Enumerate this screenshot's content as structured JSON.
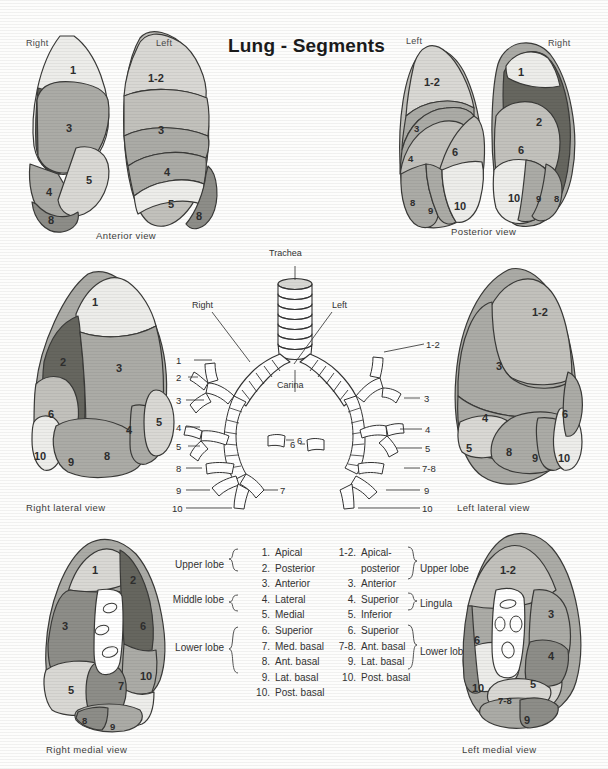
{
  "title": "Lung - Segments",
  "views": {
    "anterior": {
      "caption": "Anterior view",
      "right_label": "Right",
      "left_label": "Left",
      "right_segments": [
        "1",
        "2",
        "3",
        "4",
        "5",
        "8"
      ],
      "left_segments": [
        "1-2",
        "3",
        "4",
        "5",
        "8"
      ]
    },
    "posterior": {
      "caption": "Posterior view",
      "left_label": "Left",
      "right_label": "Right",
      "left_segments": [
        "1-2",
        "3",
        "4",
        "6",
        "8",
        "9",
        "10"
      ],
      "right_segments": [
        "1",
        "2",
        "6",
        "10",
        "9",
        "8"
      ]
    },
    "right_lateral": {
      "caption": "Right lateral view",
      "segments": [
        "1",
        "2",
        "3",
        "4",
        "5",
        "6",
        "8",
        "9",
        "10"
      ]
    },
    "left_lateral": {
      "caption": "Left lateral view",
      "segments": [
        "1-2",
        "3",
        "4",
        "5",
        "6",
        "8",
        "9",
        "10"
      ]
    },
    "right_medial": {
      "caption": "Right medial view",
      "segments": [
        "1",
        "2",
        "3",
        "5",
        "6",
        "7",
        "8",
        "9",
        "10"
      ]
    },
    "left_medial": {
      "caption": "Left medial view",
      "segments": [
        "1-2",
        "3",
        "4",
        "5",
        "6",
        "7-8",
        "9",
        "10"
      ]
    }
  },
  "bronchial_tree": {
    "trachea_label": "Trachea",
    "carina_label": "Carina",
    "right_label": "Right",
    "left_label": "Left",
    "right_numbers": [
      "1",
      "2",
      "3",
      "4",
      "5",
      "8",
      "9",
      "10"
    ],
    "right_inner_numbers": [
      "6",
      "7"
    ],
    "left_numbers": [
      "1-2",
      "3",
      "4",
      "5",
      "7-8",
      "9",
      "10"
    ],
    "left_inner_numbers": [
      "6"
    ]
  },
  "legend": {
    "right_lung": {
      "lobes": [
        {
          "name": "Upper lobe",
          "from": 0,
          "to": 2
        },
        {
          "name": "Middle lobe",
          "from": 3,
          "to": 4
        },
        {
          "name": "Lower lobe",
          "from": 5,
          "to": 9
        }
      ],
      "items": [
        {
          "num": "1.",
          "name": "Apical"
        },
        {
          "num": "2.",
          "name": "Posterior"
        },
        {
          "num": "3.",
          "name": "Anterior"
        },
        {
          "num": "4.",
          "name": "Lateral"
        },
        {
          "num": "5.",
          "name": "Medial"
        },
        {
          "num": "6.",
          "name": "Superior"
        },
        {
          "num": "7.",
          "name": "Med. basal"
        },
        {
          "num": "8.",
          "name": "Ant. basal"
        },
        {
          "num": "9.",
          "name": "Lat. basal"
        },
        {
          "num": "10.",
          "name": "Post. basal"
        }
      ]
    },
    "left_lung": {
      "lobes": [
        {
          "name": "Upper lobe"
        },
        {
          "name": "Lingula"
        },
        {
          "name": "Lower lobe"
        }
      ],
      "items": [
        {
          "num": "1-2.",
          "name": "Apical-"
        },
        {
          "num": "",
          "name": "posterior"
        },
        {
          "num": "3.",
          "name": "Anterior"
        },
        {
          "num": "4.",
          "name": "Superior"
        },
        {
          "num": "5.",
          "name": "Inferior"
        },
        {
          "num": "6.",
          "name": "Superior"
        },
        {
          "num": "7-8.",
          "name": "Ant. basal"
        },
        {
          "num": "9.",
          "name": "Lat. basal"
        },
        {
          "num": "10.",
          "name": "Post. basal"
        }
      ]
    }
  },
  "colors": {
    "tone_lightest": "#ededea",
    "tone_light": "#d9d8d4",
    "tone_mid_light": "#c2c1bc",
    "tone_mid": "#ababa6",
    "tone_dark": "#8d8d88",
    "tone_darkest": "#66665f",
    "outline": "#3a3a38",
    "paper": "#fdfdfc"
  }
}
